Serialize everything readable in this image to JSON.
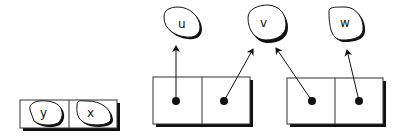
{
  "diagram": {
    "left_box": {
      "cells": [
        {
          "label": "y"
        },
        {
          "label": "x"
        }
      ]
    },
    "middle_box": {
      "cells": [
        {
          "pointer_to": "u"
        },
        {
          "pointer_to": "v"
        }
      ]
    },
    "right_box": {
      "cells": [
        {
          "pointer_to": "v"
        },
        {
          "pointer_to": "w"
        }
      ]
    },
    "nodes": [
      {
        "label": "u"
      },
      {
        "label": "v"
      },
      {
        "label": "w"
      }
    ],
    "colors": {
      "stroke": "#111111",
      "shadow": "#111111",
      "fill": "#ffffff"
    }
  }
}
